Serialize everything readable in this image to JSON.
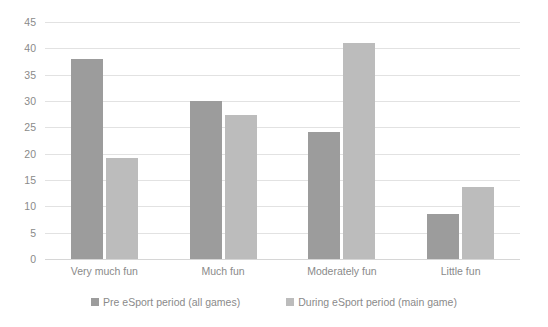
{
  "chart_data": {
    "type": "bar",
    "title": "",
    "subtitle": "",
    "xlabel": "",
    "ylabel": "",
    "categories": [
      "Very much fun",
      "Much fun",
      "Moderately fun",
      "Little fun"
    ],
    "series": [
      {
        "name": "Pre eSport period (all games)",
        "color": "#9c9c9c",
        "values": [
          38,
          30,
          24.2,
          8.5
        ]
      },
      {
        "name": "During eSport period (main game)",
        "color": "#bcbcbc",
        "values": [
          19.2,
          27.3,
          41,
          13.7
        ]
      }
    ],
    "ylim": [
      0,
      45
    ],
    "ytick_labels": [
      "45",
      "40",
      "35",
      "30",
      "25",
      "20",
      "15",
      "10",
      "5",
      "0"
    ],
    "ytick_values": [
      45,
      40,
      35,
      30,
      25,
      20,
      15,
      10,
      5,
      0
    ],
    "grid": true,
    "grid_color": "#e2e2e2",
    "legend_position": "bottom",
    "background": "#ffffff",
    "text_color": "#8a8a8a"
  }
}
